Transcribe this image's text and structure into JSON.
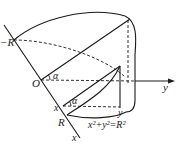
{
  "diagram": {
    "type": "3d-solid-wedge-cylinder",
    "labels": {
      "neg_r": "−R",
      "origin": "O",
      "alpha_top": "α",
      "alpha_bottom": "α",
      "x_point": "x",
      "r_point": "R",
      "x_axis": "x",
      "y_axis": "y",
      "y_point": "y",
      "equation": "x²+y²=R²"
    },
    "colors": {
      "stroke": "#1a1a1a",
      "background": "#ffffff"
    }
  }
}
